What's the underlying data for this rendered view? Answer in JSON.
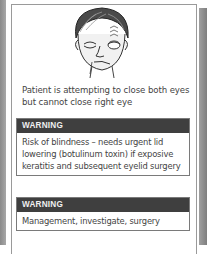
{
  "figure": {
    "illustration": "face-right-facial-palsy-icon",
    "caption": "Patient is attempting to close both eyes but cannot close right eye"
  },
  "boxes": [
    {
      "header": "WARNING",
      "body": "Risk of blindness – needs urgent lid lowering (botulinum toxin) if exposive keratitis and subsequent eyelid surgery"
    },
    {
      "header": "WARNING",
      "body": "Management, investigate, surgery"
    }
  ],
  "colors": {
    "header_bg": "#3f3f3f",
    "header_text": "#f0f0f0",
    "body_text": "#444444",
    "border": "#7a7a7a"
  }
}
